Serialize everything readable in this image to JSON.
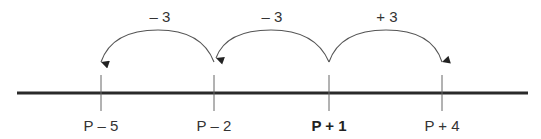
{
  "diagram": {
    "type": "number-line",
    "points": [
      {
        "label": "P – 5",
        "x": 101,
        "bold": false
      },
      {
        "label": "P – 2",
        "x": 214,
        "bold": false
      },
      {
        "label": "P + 1",
        "x": 329,
        "bold": true
      },
      {
        "label": "P + 4",
        "x": 442,
        "bold": false
      }
    ],
    "jumps": [
      {
        "label": "– 3",
        "from": "P + 1",
        "to": "P – 2"
      },
      {
        "label": "– 3",
        "from": "P – 2",
        "to": "P – 5"
      },
      {
        "label": "+ 3",
        "from": "P + 1",
        "to": "P + 4"
      }
    ],
    "colors": {
      "line": "#2a2a2a",
      "tick": "#555555",
      "arc": "#555555",
      "text": "#333333"
    }
  }
}
